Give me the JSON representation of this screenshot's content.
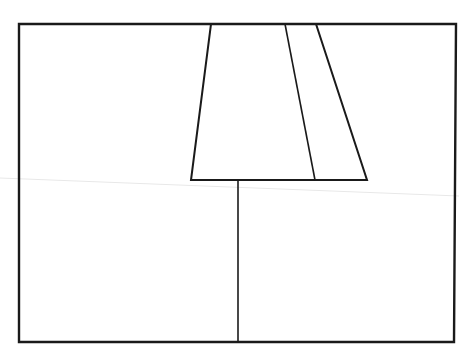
{
  "diagram": {
    "type": "line-drawing",
    "stroke_color": "#1a1a1a",
    "artifact_color": "#e8e8e8",
    "canvas": {
      "width": 459,
      "height": 362
    },
    "frame": {
      "x1": 19,
      "y1": 24,
      "x2": 456,
      "y2": 342
    },
    "trapezoid": {
      "top_left": [
        211,
        24
      ],
      "top_right": [
        316,
        24
      ],
      "bottom_right": [
        367,
        180
      ],
      "bottom_left": [
        191,
        180
      ]
    },
    "inner_slant_line": {
      "from": [
        285,
        24
      ],
      "to": [
        315,
        180
      ]
    },
    "stem_line": {
      "from": [
        238,
        180
      ],
      "to": [
        238,
        342
      ]
    },
    "scan_artifact_line": {
      "from": [
        0,
        178
      ],
      "to": [
        459,
        196
      ]
    }
  }
}
